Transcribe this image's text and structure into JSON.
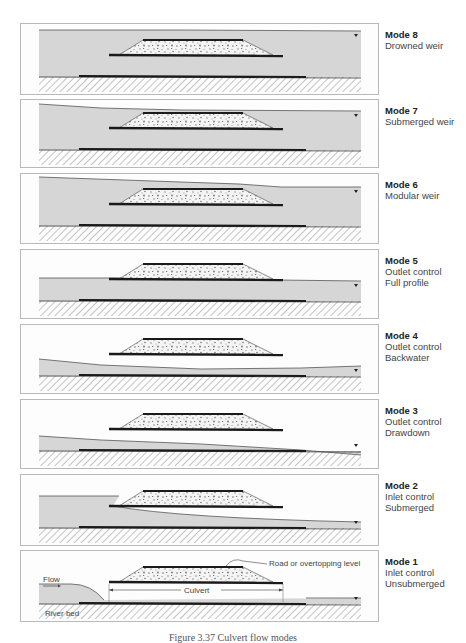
{
  "figure": {
    "caption": "Figure 3.37 Culvert flow modes",
    "colors": {
      "water": "#d6d6d6",
      "panel_bg": "#fdfdfd",
      "border": "#b9b9b9",
      "line": "#1a1a1a",
      "fill_speckle": "#777777"
    },
    "panels": [
      {
        "id": "mode-8",
        "title": "Mode 8",
        "lines": [
          "Drowned weir"
        ],
        "top": 23,
        "height": 72,
        "water": "full",
        "surface": [
          [
            38,
            6
          ],
          [
            180,
            6
          ],
          [
            360,
            7
          ]
        ]
      },
      {
        "id": "mode-7",
        "title": "Mode 7",
        "lines": [
          "Submerged weir"
        ],
        "top": 99,
        "height": 69,
        "water": "full",
        "surface": [
          [
            38,
            4
          ],
          [
            100,
            8
          ],
          [
            180,
            10
          ],
          [
            360,
            11
          ]
        ]
      },
      {
        "id": "mode-6",
        "title": "Mode 6",
        "lines": [
          "Modular weir"
        ],
        "top": 173,
        "height": 71,
        "water": "full",
        "surface": [
          [
            38,
            3
          ],
          [
            180,
            8
          ],
          [
            238,
            10
          ],
          [
            280,
            13
          ],
          [
            360,
            13
          ]
        ]
      },
      {
        "id": "mode-5",
        "title": "Mode 5",
        "lines": [
          "Outlet control",
          "Full profile"
        ],
        "top": 249,
        "height": 70,
        "water": "full",
        "surface": [
          [
            38,
            28
          ],
          [
            112,
            28
          ],
          [
            112,
            28
          ],
          [
            276,
            30
          ],
          [
            360,
            31
          ]
        ]
      },
      {
        "id": "mode-4",
        "title": "Mode 4",
        "lines": [
          "Outlet control",
          "Backwater"
        ],
        "top": 324,
        "height": 70,
        "water": "low",
        "surface": [
          [
            38,
            34
          ],
          [
            100,
            40
          ],
          [
            200,
            44
          ],
          [
            300,
            43
          ],
          [
            360,
            41
          ]
        ]
      },
      {
        "id": "mode-3",
        "title": "Mode 3",
        "lines": [
          "Outlet control",
          "Drawdown"
        ],
        "top": 399,
        "height": 70,
        "water": "low",
        "surface": [
          [
            38,
            36
          ],
          [
            100,
            40
          ],
          [
            200,
            44
          ],
          [
            300,
            50
          ],
          [
            360,
            55
          ]
        ]
      },
      {
        "id": "mode-2",
        "title": "Mode 2",
        "lines": [
          "Inlet control",
          "Submerged"
        ],
        "top": 474,
        "height": 72,
        "water": "inlet-submerged",
        "surface": [
          [
            38,
            21
          ],
          [
            110,
            21
          ]
        ]
      },
      {
        "id": "mode-1",
        "title": "Mode 1",
        "lines": [
          "Inlet control",
          "Unsubmerged"
        ],
        "top": 550,
        "height": 72,
        "water": "inlet-free",
        "surface": [
          [
            38,
            33
          ],
          [
            70,
            33
          ],
          [
            103,
            44
          ]
        ]
      }
    ],
    "annotations": {
      "flow_label": "Flow",
      "river_bed_label": "River bed",
      "culvert_label": "Culvert",
      "road_label": "Road or overtopping level"
    }
  }
}
